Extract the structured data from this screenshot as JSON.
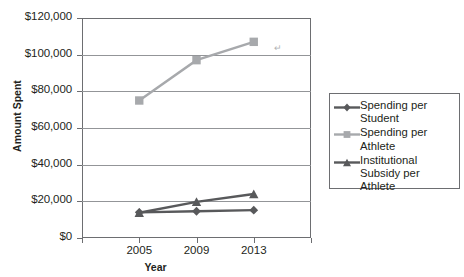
{
  "chart_data": {
    "type": "line",
    "title": "",
    "xlabel": "Year",
    "ylabel": "Amount Spent",
    "categories": [
      "2005",
      "2009",
      "2013"
    ],
    "x": [
      2005,
      2009,
      2013
    ],
    "ylim": [
      0,
      120000
    ],
    "ytick_values": [
      0,
      20000,
      40000,
      60000,
      80000,
      100000,
      120000
    ],
    "ytick_labels": [
      "$0",
      "$20,000",
      "$40,000",
      "$60,000",
      "$80,000",
      "$100,000",
      "$120,000"
    ],
    "grid": true,
    "legend_position": "right",
    "series": [
      {
        "name": "Spending per Student",
        "legend_label": "Spending per\nStudent",
        "marker": "diamond",
        "color": "#58595b",
        "values": [
          14000,
          14600,
          15200
        ]
      },
      {
        "name": "Spending per Athlete",
        "legend_label": "Spending per\nAthlete",
        "marker": "square",
        "color": "#a7a9ac",
        "values": [
          75000,
          97000,
          107000
        ]
      },
      {
        "name": "Institutional Subsidy per Athlete",
        "legend_label": "Institutional\nSubsidy per Athlete",
        "marker": "triangle",
        "color": "#58595b",
        "values": [
          13800,
          19700,
          24000
        ]
      }
    ]
  },
  "axes": {
    "y_title": "Amount Spent",
    "x_title": "Year"
  },
  "colors": {
    "axis": "#6d6e71",
    "grid": "#939598",
    "text": "#231f20",
    "series_dark": "#58595b",
    "series_light": "#a7a9ac",
    "background": "#ffffff"
  }
}
